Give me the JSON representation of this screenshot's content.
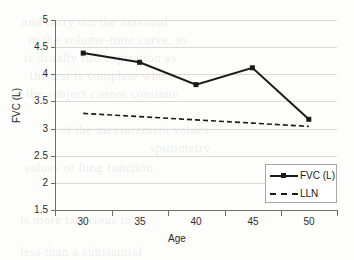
{
  "chart_data": {
    "type": "line",
    "title": "",
    "xlabel": "Age",
    "ylabel": "FVC (L)",
    "categories": [
      30,
      35,
      40,
      45,
      50
    ],
    "x_tick_labels": [
      "30",
      "35",
      "40",
      "45",
      "50"
    ],
    "y_tick_labels": [
      "5",
      "4.5",
      "4",
      "3.5",
      "3",
      "2.5",
      "2",
      "1.5"
    ],
    "y_ticks": [
      5,
      4.5,
      4,
      3.5,
      3,
      2.5,
      2,
      1.5
    ],
    "ylim": [
      1.5,
      5
    ],
    "grid": "horizontal",
    "legend_position": "lower-right",
    "series": [
      {
        "name": "FVC (L)",
        "style": "solid",
        "marker": "square",
        "color": "#1a1a1a",
        "values": [
          4.39,
          4.22,
          3.81,
          4.12,
          3.17
        ]
      },
      {
        "name": "LLN",
        "style": "dashed",
        "marker": "none",
        "color": "#1a1a1a",
        "values": [
          3.28,
          3.22,
          3.16,
          3.1,
          3.04
        ]
      }
    ]
  },
  "legend": {
    "items": [
      {
        "label": "FVC (L)"
      },
      {
        "label": "LLN"
      }
    ]
  },
  "background_text": {
    "lines": [
      "and carry out the maximal",
      "in the volume-time curve, to",
      "is usually full expiration as",
      "the test is complete when",
      "the subject cannot continue",
      "of the measurement values",
      "spirometry",
      "values of lung function",
      "is more laborious to",
      "less than a substantial"
    ]
  }
}
